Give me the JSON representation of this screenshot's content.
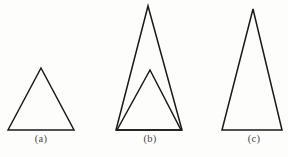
{
  "figure": {
    "background_color": "#fdfdfc",
    "stroke_color": "#1a1a1a",
    "label_color": "#4a4a4a",
    "width": 288,
    "height": 157,
    "panels": [
      {
        "id": "a",
        "label": "(a)",
        "label_x": 41,
        "label_y": 139,
        "shapes": [
          {
            "name": "triangle-a",
            "points": "8,130 41,68 74,130",
            "stroke_width": 1.5,
            "apex": [
              41,
              68
            ],
            "base_left": [
              8,
              130
            ],
            "base_right": [
              74,
              130
            ],
            "base_width": 66,
            "height": 62
          }
        ]
      },
      {
        "id": "b",
        "label": "(b)",
        "label_x": 150,
        "label_y": 139,
        "shapes": [
          {
            "name": "triangle-b-outer",
            "points": "116,130 148,6 182,130",
            "stroke_width": 1.5,
            "apex": [
              148,
              6
            ],
            "base_left": [
              116,
              130
            ],
            "base_right": [
              182,
              130
            ],
            "base_width": 66,
            "height": 124
          },
          {
            "name": "triangle-b-inner",
            "points": "117,130 150,70 181,130",
            "stroke_width": 1.5,
            "apex": [
              150,
              70
            ],
            "base_left": [
              117,
              130
            ],
            "base_right": [
              181,
              130
            ],
            "base_width": 64,
            "height": 60
          }
        ]
      },
      {
        "id": "c",
        "label": "(c)",
        "label_x": 254,
        "label_y": 139,
        "shapes": [
          {
            "name": "triangle-c",
            "points": "222,130 253,9 282,130",
            "stroke_width": 1.5,
            "apex": [
              253,
              9
            ],
            "base_left": [
              222,
              130
            ],
            "base_right": [
              282,
              130
            ],
            "base_width": 60,
            "height": 121
          }
        ]
      }
    ]
  }
}
